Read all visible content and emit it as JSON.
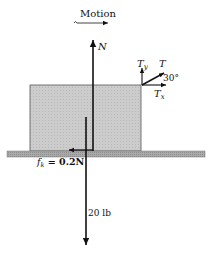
{
  "diagram": {
    "type": "free-body-diagram",
    "motion_label": "Motion",
    "colors": {
      "block_fill": "#c8c8c8",
      "ground_fill": "#a8a8a8",
      "line": "#111111",
      "background": "#ffffff"
    },
    "forces": {
      "normal": {
        "label": "N"
      },
      "weight": {
        "label": "20 lb"
      },
      "friction": {
        "label_symbol": "f",
        "label_subscript": "k",
        "label_rest": " = 0.2N"
      },
      "tension": {
        "label": "T",
        "angle_label": "30°"
      },
      "tension_y": {
        "label_symbol": "T",
        "label_subscript": "y"
      },
      "tension_x": {
        "label_symbol": "T",
        "label_subscript": "x"
      }
    }
  }
}
